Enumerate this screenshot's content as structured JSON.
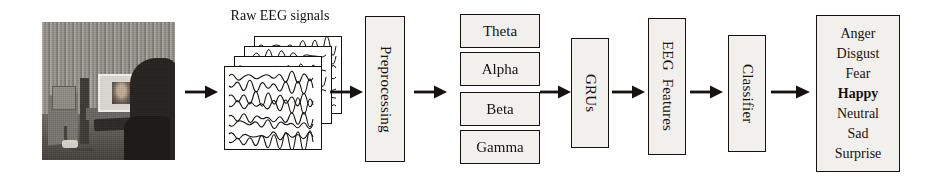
{
  "figure": {
    "type": "pipeline-diagram"
  },
  "stimulus": {
    "name": "stimulus-photograph",
    "alt": "grayscale photo of a room with a monitor, desk and a person"
  },
  "signals": {
    "label": "Raw EEG signals",
    "card_count": 4,
    "trace_count": 8
  },
  "stages": {
    "preprocessing": "Preprocessing",
    "grus": "GRUs",
    "eeg_features": "EEG  Features",
    "classifier": "Classifier"
  },
  "bands": [
    {
      "label": "Theta"
    },
    {
      "label": "Alpha"
    },
    {
      "label": "Beta"
    },
    {
      "label": "Gamma"
    }
  ],
  "emotions": [
    {
      "label": "Anger",
      "selected": false
    },
    {
      "label": "Disgust",
      "selected": false
    },
    {
      "label": "Fear",
      "selected": false
    },
    {
      "label": "Happy",
      "selected": true
    },
    {
      "label": "Neutral",
      "selected": false
    },
    {
      "label": "Sad",
      "selected": false
    },
    {
      "label": "Surprise",
      "selected": false
    }
  ],
  "arrows": {
    "count": 7,
    "color": "#17120f",
    "direction": "right"
  },
  "colors": {
    "ink": "#17120f",
    "box_fill": "#f2f0ed",
    "page": "#ffffff"
  }
}
